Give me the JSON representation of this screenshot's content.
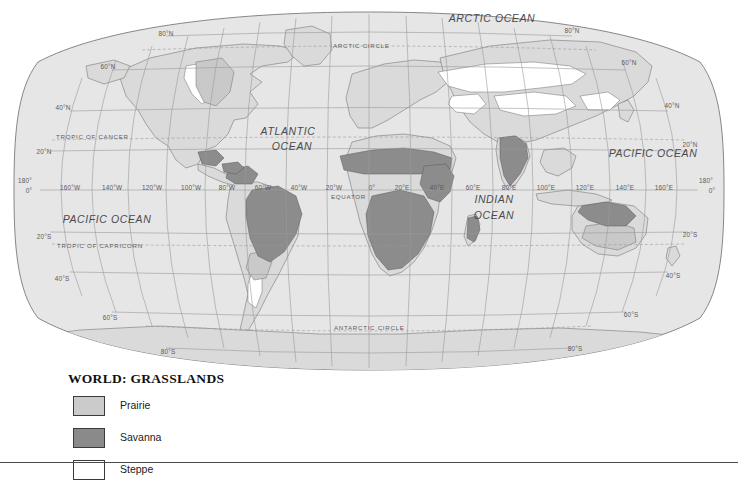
{
  "figure": {
    "kind": "thematic-world-map",
    "projection": "Robinson"
  },
  "legend": {
    "title": "WORLD: GRASSLANDS",
    "items": [
      {
        "label": "Prairie",
        "color": "#cbcbcb"
      },
      {
        "label": "Savanna",
        "color": "#8a8a8a"
      },
      {
        "label": "Steppe",
        "color": "#ffffff"
      }
    ]
  },
  "map": {
    "land_color": "#d8d8d8",
    "ocean_color": "#e4e4e4",
    "graticule_color": "#9a9a9a",
    "coastline_color": "#6e6e6e",
    "ocean_labels": [
      {
        "text": "ARCTIC OCEAN",
        "x": 492,
        "y": 22
      },
      {
        "text": "ATLANTIC",
        "x": 288,
        "y": 135
      },
      {
        "text": "OCEAN",
        "x": 292,
        "y": 150
      },
      {
        "text": "PACIFIC OCEAN",
        "x": 107,
        "y": 223
      },
      {
        "text": "PACIFIC OCEAN",
        "x": 653,
        "y": 157
      },
      {
        "text": "INDIAN",
        "x": 494,
        "y": 203
      },
      {
        "text": "OCEAN",
        "x": 494,
        "y": 219
      }
    ],
    "latitude_labels_left": [
      {
        "text": "80°N",
        "x": 166,
        "y": 36
      },
      {
        "text": "60°N",
        "x": 108,
        "y": 69
      },
      {
        "text": "40°N",
        "x": 63,
        "y": 110
      },
      {
        "text": "20°N",
        "x": 44,
        "y": 154
      },
      {
        "text": "20°S",
        "x": 44,
        "y": 239
      },
      {
        "text": "40°S",
        "x": 62,
        "y": 281
      },
      {
        "text": "60°S",
        "x": 110,
        "y": 320
      },
      {
        "text": "80°S",
        "x": 168,
        "y": 354
      }
    ],
    "latitude_labels_right": [
      {
        "text": "80°N",
        "x": 572,
        "y": 33
      },
      {
        "text": "60°N",
        "x": 629,
        "y": 65
      },
      {
        "text": "40°N",
        "x": 672,
        "y": 108
      },
      {
        "text": "20°N",
        "x": 690,
        "y": 147
      },
      {
        "text": "20°S",
        "x": 690,
        "y": 237
      },
      {
        "text": "40°S",
        "x": 673,
        "y": 278
      },
      {
        "text": "60°S",
        "x": 631,
        "y": 317
      },
      {
        "text": "80°S",
        "x": 575,
        "y": 351
      }
    ],
    "longitude_labels": [
      {
        "text": "160°W",
        "x": 70,
        "y": 190
      },
      {
        "text": "140°W",
        "x": 112,
        "y": 190
      },
      {
        "text": "120°W",
        "x": 152,
        "y": 190
      },
      {
        "text": "100°W",
        "x": 191,
        "y": 190
      },
      {
        "text": "80°W",
        "x": 227,
        "y": 190
      },
      {
        "text": "60°W",
        "x": 263,
        "y": 190
      },
      {
        "text": "40°W",
        "x": 299,
        "y": 190
      },
      {
        "text": "20°W",
        "x": 334,
        "y": 190
      },
      {
        "text": "0°",
        "x": 372,
        "y": 190
      },
      {
        "text": "20°E",
        "x": 402,
        "y": 190
      },
      {
        "text": "40°E",
        "x": 437,
        "y": 190
      },
      {
        "text": "60°E",
        "x": 473,
        "y": 190
      },
      {
        "text": "80°E",
        "x": 509,
        "y": 190
      },
      {
        "text": "100°E",
        "x": 546,
        "y": 190
      },
      {
        "text": "120°E",
        "x": 585,
        "y": 190
      },
      {
        "text": "140°E",
        "x": 625,
        "y": 190
      },
      {
        "text": "160°E",
        "x": 664,
        "y": 190
      }
    ],
    "antimeridian_labels": [
      {
        "text": "180°",
        "x": 25,
        "y": 183
      },
      {
        "text": "0°",
        "x": 29,
        "y": 193
      },
      {
        "text": "180°",
        "x": 706,
        "y": 183
      },
      {
        "text": "0°",
        "x": 712,
        "y": 193
      }
    ],
    "special_lines": [
      {
        "text": "ARCTIC CIRCLE",
        "x": 333,
        "y": 48,
        "anchor": "start"
      },
      {
        "text": "TROPIC OF CANCER",
        "x": 56,
        "y": 139,
        "anchor": "start"
      },
      {
        "text": "EQUATOR",
        "x": 331,
        "y": 199,
        "anchor": "start"
      },
      {
        "text": "TROPIC OF CAPRICORN",
        "x": 57,
        "y": 248,
        "anchor": "start"
      },
      {
        "text": "ANTARCTIC CIRCLE",
        "x": 334,
        "y": 330,
        "anchor": "start"
      }
    ],
    "grassland_regions": [
      {
        "name": "north-american-prairie",
        "type": "Prairie"
      },
      {
        "name": "argentine-pampas",
        "type": "Prairie"
      },
      {
        "name": "australian-interior",
        "type": "Prairie"
      },
      {
        "name": "brazilian-cerrado",
        "type": "Savanna"
      },
      {
        "name": "llanos-venezuela",
        "type": "Savanna"
      },
      {
        "name": "sahel-sudan-belt",
        "type": "Savanna"
      },
      {
        "name": "east-african-savanna",
        "type": "Savanna"
      },
      {
        "name": "southern-african-veld",
        "type": "Savanna"
      },
      {
        "name": "madagascar-savanna",
        "type": "Savanna"
      },
      {
        "name": "indian-deccan-savanna",
        "type": "Savanna"
      },
      {
        "name": "northern-australia-savanna",
        "type": "Savanna"
      },
      {
        "name": "eurasian-steppe",
        "type": "Steppe"
      },
      {
        "name": "great-plains-steppe",
        "type": "Steppe"
      },
      {
        "name": "patagonian-steppe",
        "type": "Steppe"
      },
      {
        "name": "central-asian-steppe",
        "type": "Steppe"
      }
    ]
  }
}
